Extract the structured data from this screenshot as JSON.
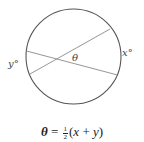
{
  "diagram": {
    "circle": {
      "cx": 73.5,
      "cy": 56.5,
      "r": 47.5,
      "stroke": "#555555"
    },
    "chords": [
      {
        "name": "chord-1",
        "x1": 26.5,
        "y1": 51,
        "x2": 117.5,
        "y2": 75,
        "stroke": "#888888"
      },
      {
        "name": "chord-2",
        "x1": 30,
        "y1": 74,
        "x2": 110,
        "y2": 29,
        "stroke": "#888888"
      }
    ],
    "labels": {
      "theta": "θ",
      "x_arc": "x°",
      "y_arc": "y°"
    }
  },
  "formula": {
    "lhs": "θ",
    "equals": " = ",
    "frac_num": "1",
    "frac_den": "2",
    "rhs_open": "(",
    "var_x": "x",
    "plus": " + ",
    "var_y": "y",
    "rhs_close": ")"
  }
}
